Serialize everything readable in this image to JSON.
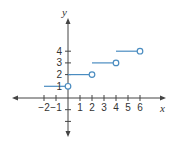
{
  "chart_data": {
    "type": "line",
    "subtype": "step-function",
    "title": "",
    "xlabel": "x",
    "ylabel": "y",
    "x_ticks": [
      -2,
      -1,
      1,
      2,
      3,
      4,
      5,
      6
    ],
    "y_ticks": [
      1,
      2,
      3,
      4
    ],
    "x_tick_labels": [
      "−2",
      "−1",
      "1",
      "2",
      "3",
      "4",
      "5",
      "6"
    ],
    "y_tick_labels": [
      "1",
      "2",
      "3",
      "4"
    ],
    "xlim": [
      -4.5,
      8.2
    ],
    "ylim": [
      -3.4,
      6.8
    ],
    "grid": false,
    "legend": null,
    "segments": [
      {
        "x_start": -2,
        "x_end": 0,
        "y": 1,
        "start_closed": true,
        "end_marker": "open"
      },
      {
        "x_start": 0,
        "x_end": 2,
        "y": 2,
        "start_closed": true,
        "end_marker": "open"
      },
      {
        "x_start": 2,
        "x_end": 4,
        "y": 3,
        "start_closed": true,
        "end_marker": "open"
      },
      {
        "x_start": 4,
        "x_end": 6,
        "y": 4,
        "start_closed": true,
        "end_marker": "open"
      }
    ],
    "colors": {
      "series": "#4a8cc0",
      "axes": "#444444"
    }
  }
}
